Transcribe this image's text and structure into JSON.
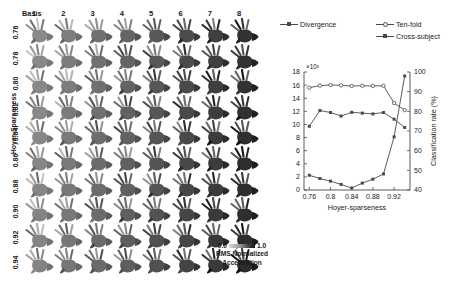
{
  "figure": {
    "left_panel": {
      "basis_label": "Basis",
      "column_headers": [
        "1",
        "2",
        "3",
        "4",
        "5",
        "6",
        "7",
        "8"
      ],
      "row_axis_title": "Hoyer-Sparseness",
      "row_headers": [
        "0.76",
        "0.78",
        "0.80",
        "0.82",
        "0.84",
        "0.86",
        "0.88",
        "0.90",
        "0.92",
        "0.94"
      ],
      "colorbar": {
        "min_label": "0.0",
        "max_label": "1.0",
        "caption_line1": "RMS Normalized",
        "caption_line2": "Acceleration",
        "low_color": "#d8d8d8",
        "high_color": "#141414"
      }
    }
  },
  "chart_data": {
    "type": "line",
    "title": "",
    "xlabel": "Hoyer-sparseness",
    "ylabel": "",
    "y2label": "Classification rate (%)",
    "y_exponent_label": "×10³",
    "xlim": [
      0.75,
      0.95
    ],
    "ylim": [
      0,
      18
    ],
    "y2lim": [
      40,
      100
    ],
    "xticks": [
      "0.76",
      "0.8",
      "0.84",
      "0.88",
      "0.92"
    ],
    "xtick_values": [
      0.76,
      0.8,
      0.84,
      0.88,
      0.92
    ],
    "yticks": [
      "0",
      "2",
      "4",
      "6",
      "8",
      "10",
      "12",
      "14",
      "16",
      "18"
    ],
    "ytick_values": [
      0,
      2,
      4,
      6,
      8,
      10,
      12,
      14,
      16,
      18
    ],
    "y2ticks": [
      "40",
      "50",
      "60",
      "70",
      "80",
      "90",
      "100"
    ],
    "y2tick_values": [
      40,
      50,
      60,
      70,
      80,
      90,
      100
    ],
    "grid": false,
    "legend_position": "top",
    "x": [
      0.76,
      0.78,
      0.8,
      0.82,
      0.84,
      0.86,
      0.88,
      0.9,
      0.92,
      0.94
    ],
    "series": [
      {
        "name": "Divergence",
        "axis": "left",
        "marker": "square",
        "color": "#4a4a4a",
        "values": [
          2.25,
          1.75,
          1.35,
          0.85,
          0.3,
          1.05,
          1.65,
          2.45,
          8.1,
          17.4
        ]
      },
      {
        "name": "Ten-fold",
        "axis": "right",
        "marker": "circle",
        "color": "#4a4a4a",
        "values": [
          92.0,
          93.1,
          93.4,
          93.2,
          92.9,
          93.0,
          92.9,
          93.0,
          84.2,
          80.6
        ]
      },
      {
        "name": "Cross-subject",
        "axis": "right",
        "marker": "square",
        "color": "#4a4a4a",
        "values": [
          72.4,
          80.4,
          79.4,
          77.6,
          79.5,
          79.1,
          78.7,
          79.4,
          76.0,
          71.8
        ]
      }
    ]
  }
}
